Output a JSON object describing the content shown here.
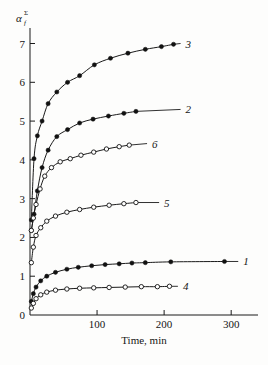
{
  "chart_data": {
    "type": "line",
    "title": "",
    "xlabel": "Time, min",
    "ylabel": "α",
    "ylabel_sub": "f",
    "ylabel_sup": "Σ",
    "xlim": [
      0,
      340
    ],
    "ylim": [
      0,
      7.4
    ],
    "xticks": [
      100,
      200,
      300
    ],
    "xtick_labels": [
      "100",
      "200",
      "300"
    ],
    "yticks": [
      0,
      1,
      2,
      3,
      4,
      5,
      6,
      7
    ],
    "ytick_labels": [
      "0",
      "1",
      "2",
      "3",
      "4",
      "5",
      "6",
      "7"
    ],
    "grid": false,
    "legend": "inline-curve-labels",
    "series": [
      {
        "name": "1",
        "label": "1",
        "marker": "filled-circle",
        "label_x": 318,
        "label_y": 1.38,
        "x": [
          2,
          5,
          9,
          16,
          25,
          38,
          55,
          72,
          92,
          112,
          133,
          152,
          172,
          210,
          290
        ],
        "y": [
          0.35,
          0.55,
          0.72,
          0.88,
          1.0,
          1.1,
          1.18,
          1.23,
          1.27,
          1.3,
          1.32,
          1.34,
          1.35,
          1.37,
          1.38
        ]
      },
      {
        "name": "2",
        "label": "2",
        "marker": "filled-circle",
        "label_x": 232,
        "label_y": 5.3,
        "x": [
          2,
          6,
          11,
          18,
          27,
          40,
          56,
          74,
          94,
          117,
          140,
          158
        ],
        "y": [
          2.18,
          2.6,
          3.2,
          3.8,
          4.25,
          4.6,
          4.78,
          4.95,
          5.05,
          5.13,
          5.2,
          5.25
        ]
      },
      {
        "name": "3",
        "label": "3",
        "marker": "filled-circle",
        "label_x": 232,
        "label_y": 7.0,
        "x": [
          2,
          6,
          11,
          18,
          27,
          40,
          56,
          74,
          96,
          120,
          146,
          172,
          196,
          214
        ],
        "y": [
          2.45,
          4.03,
          4.62,
          5.0,
          5.45,
          5.75,
          6.0,
          6.17,
          6.45,
          6.62,
          6.75,
          6.85,
          6.92,
          6.98
        ]
      },
      {
        "name": "4",
        "label": "4",
        "marker": "open-circle",
        "label_x": 228,
        "label_y": 0.74,
        "x": [
          2,
          5,
          9,
          16,
          25,
          38,
          55,
          74,
          95,
          118,
          142,
          166,
          190,
          208
        ],
        "y": [
          0.18,
          0.3,
          0.42,
          0.52,
          0.59,
          0.64,
          0.67,
          0.69,
          0.7,
          0.71,
          0.72,
          0.73,
          0.73,
          0.74
        ]
      },
      {
        "name": "5",
        "label": "5",
        "marker": "open-circle",
        "label_x": 200,
        "label_y": 2.9,
        "x": [
          2,
          5,
          9,
          16,
          25,
          38,
          55,
          74,
          95,
          118,
          140,
          158
        ],
        "y": [
          1.35,
          1.75,
          2.05,
          2.25,
          2.42,
          2.55,
          2.65,
          2.72,
          2.78,
          2.83,
          2.87,
          2.9
        ]
      },
      {
        "name": "6",
        "label": "6",
        "marker": "open-circle",
        "label_x": 182,
        "label_y": 4.42,
        "x": [
          2,
          5,
          9,
          15,
          22,
          32,
          45,
          60,
          76,
          95,
          114,
          133,
          148
        ],
        "y": [
          2.18,
          2.5,
          2.85,
          3.25,
          3.58,
          3.8,
          3.95,
          4.03,
          4.12,
          4.2,
          4.28,
          4.34,
          4.38
        ]
      }
    ]
  }
}
